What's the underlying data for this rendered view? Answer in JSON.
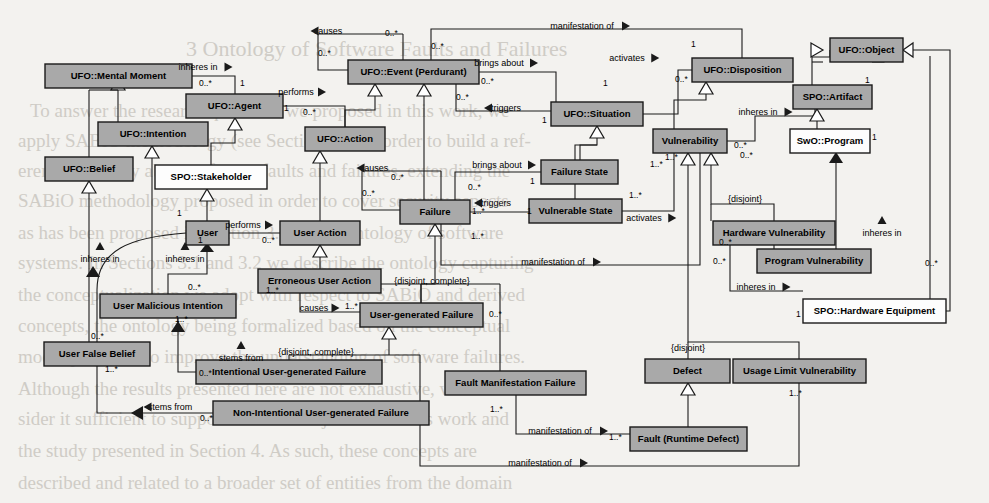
{
  "diagram": {
    "background_color": "#f3f2ef",
    "class_fill_gray": "#a9a9a9",
    "class_fill_white": "#fdfdfd",
    "stroke_color": "#1a1a1a",
    "width": 989,
    "height": 503
  },
  "classes": [
    {
      "id": "mental_moment",
      "label": "UFO::Mental Moment",
      "x": 45,
      "y": 64,
      "w": 147,
      "h": 24,
      "fill": "gray"
    },
    {
      "id": "agent",
      "label": "UFO::Agent",
      "x": 186,
      "y": 94,
      "w": 97,
      "h": 24,
      "fill": "gray"
    },
    {
      "id": "intention",
      "label": "UFO::Intention",
      "x": 98,
      "y": 122,
      "w": 110,
      "h": 24,
      "fill": "gray"
    },
    {
      "id": "belief",
      "label": "UFO::Belief",
      "x": 45,
      "y": 157,
      "w": 88,
      "h": 24,
      "fill": "gray"
    },
    {
      "id": "stakeholder",
      "label": "SPO::Stakeholder",
      "x": 155,
      "y": 165,
      "w": 112,
      "h": 24,
      "fill": "white"
    },
    {
      "id": "user",
      "label": "User",
      "x": 186,
      "y": 221,
      "w": 43,
      "h": 24,
      "fill": "gray"
    },
    {
      "id": "user_action",
      "label": "User Action",
      "x": 280,
      "y": 221,
      "w": 80,
      "h": 24,
      "fill": "gray"
    },
    {
      "id": "erroneous_user_action",
      "label": "Erroneous User Action",
      "x": 258,
      "y": 269,
      "w": 123,
      "h": 24,
      "fill": "gray"
    },
    {
      "id": "user_malicious_intention",
      "label": "User Malicious Intention",
      "x": 100,
      "y": 294,
      "w": 136,
      "h": 24,
      "fill": "gray"
    },
    {
      "id": "user_false_belief",
      "label": "User False Belief",
      "x": 44,
      "y": 342,
      "w": 106,
      "h": 24,
      "fill": "gray"
    },
    {
      "id": "intentional_ugf",
      "label": "Intentional User-generated Failure",
      "x": 196,
      "y": 360,
      "w": 186,
      "h": 24,
      "fill": "gray"
    },
    {
      "id": "non_intentional_ugf",
      "label": "Non-Intentional User-generated Failure",
      "x": 213,
      "y": 401,
      "w": 216,
      "h": 24,
      "fill": "gray"
    },
    {
      "id": "event",
      "label": "UFO::Event (Perdurant)",
      "x": 348,
      "y": 60,
      "w": 131,
      "h": 24,
      "fill": "gray"
    },
    {
      "id": "action",
      "label": "UFO::Action",
      "x": 305,
      "y": 127,
      "w": 80,
      "h": 24,
      "fill": "gray"
    },
    {
      "id": "situation",
      "label": "UFO::Situation",
      "x": 551,
      "y": 102,
      "w": 92,
      "h": 24,
      "fill": "gray"
    },
    {
      "id": "failure",
      "label": "Failure",
      "x": 400,
      "y": 200,
      "w": 70,
      "h": 24,
      "fill": "gray"
    },
    {
      "id": "failure_state",
      "label": "Failure State",
      "x": 541,
      "y": 160,
      "w": 77,
      "h": 24,
      "fill": "gray"
    },
    {
      "id": "vulnerable_state",
      "label": "Vulnerable State",
      "x": 529,
      "y": 199,
      "w": 93,
      "h": 24,
      "fill": "gray"
    },
    {
      "id": "user_generated_failure",
      "label": "User-generated Failure",
      "x": 360,
      "y": 303,
      "w": 123,
      "h": 24,
      "fill": "gray"
    },
    {
      "id": "fault_manifestation_failure",
      "label": "Fault Manifestation Failure",
      "x": 445,
      "y": 371,
      "w": 141,
      "h": 24,
      "fill": "gray"
    },
    {
      "id": "disposition",
      "label": "UFO::Disposition",
      "x": 692,
      "y": 58,
      "w": 101,
      "h": 24,
      "fill": "gray"
    },
    {
      "id": "object",
      "label": "UFO::Object",
      "x": 830,
      "y": 38,
      "w": 73,
      "h": 24,
      "fill": "gray"
    },
    {
      "id": "artifact",
      "label": "SPO::Artifact",
      "x": 793,
      "y": 85,
      "w": 79,
      "h": 24,
      "fill": "gray"
    },
    {
      "id": "program",
      "label": "SwO::Program",
      "x": 790,
      "y": 129,
      "w": 80,
      "h": 24,
      "fill": "white"
    },
    {
      "id": "vulnerability",
      "label": "Vulnerability",
      "x": 653,
      "y": 129,
      "w": 74,
      "h": 24,
      "fill": "gray"
    },
    {
      "id": "hardware_vulnerability",
      "label": "Hardware Vulnerability",
      "x": 713,
      "y": 221,
      "w": 122,
      "h": 24,
      "fill": "gray"
    },
    {
      "id": "program_vulnerability",
      "label": "Program Vulnerability",
      "x": 757,
      "y": 249,
      "w": 114,
      "h": 24,
      "fill": "gray"
    },
    {
      "id": "hardware_equipment",
      "label": "SPO::Hardware Equipment",
      "x": 803,
      "y": 299,
      "w": 143,
      "h": 24,
      "fill": "white"
    },
    {
      "id": "defect",
      "label": "Defect",
      "x": 645,
      "y": 359,
      "w": 85,
      "h": 24,
      "fill": "gray"
    },
    {
      "id": "usage_limit_vulnerability",
      "label": "Usage Limit Vulnerability",
      "x": 733,
      "y": 359,
      "w": 133,
      "h": 24,
      "fill": "gray"
    },
    {
      "id": "fault",
      "label": "Fault (Runtime Defect)",
      "x": 630,
      "y": 427,
      "w": 117,
      "h": 24,
      "fill": "gray"
    }
  ],
  "relation_labels": [
    {
      "id": "causes_event",
      "text": "causes",
      "x": 328,
      "y": 34,
      "arrow": "left"
    },
    {
      "id": "manifestation_of_top",
      "text": "manifestation of",
      "x": 582,
      "y": 29,
      "arrow": "right"
    },
    {
      "id": "inheres_in_agent",
      "text": "inheres in",
      "x": 198,
      "y": 70,
      "arrow": "right"
    },
    {
      "id": "brings_about_event",
      "text": "brings about",
      "x": 499,
      "y": 66,
      "arrow": "right"
    },
    {
      "id": "activates_situation",
      "text": "activates",
      "x": 627,
      "y": 61,
      "arrow": "right"
    },
    {
      "id": "performs_agent",
      "text": "performs",
      "x": 296,
      "y": 95,
      "arrow": "right"
    },
    {
      "id": "triggers_situation",
      "text": "triggers",
      "x": 506,
      "y": 111,
      "arrow": "left"
    },
    {
      "id": "inheres_in_artifact",
      "text": "inheres in",
      "x": 758,
      "y": 115,
      "arrow": "right"
    },
    {
      "id": "causes_failure",
      "text": "causes",
      "x": 374,
      "y": 171,
      "arrow": "left"
    },
    {
      "id": "brings_about_failure_state",
      "text": "brings about",
      "x": 497,
      "y": 168,
      "arrow": "right"
    },
    {
      "id": "triggers_failure",
      "text": "triggers",
      "x": 496,
      "y": 206,
      "arrow": "left"
    },
    {
      "id": "performs_user",
      "text": "performs",
      "x": 243,
      "y": 228,
      "arrow": "right"
    },
    {
      "id": "activates_vulnerable",
      "text": "activates",
      "x": 644,
      "y": 221,
      "arrow": "right"
    },
    {
      "id": "inheres_in_program",
      "text": "inheres in",
      "x": 882,
      "y": 236,
      "arrow": "up"
    },
    {
      "id": "inheres_in_user_false_belief",
      "text": "inheres in",
      "x": 100,
      "y": 262,
      "arrow": "up"
    },
    {
      "id": "inheres_in_user",
      "text": "inheres in",
      "x": 185,
      "y": 262,
      "arrow": "up"
    },
    {
      "id": "manifestation_of_mid",
      "text": "manifestation of",
      "x": 553,
      "y": 265,
      "arrow": "right"
    },
    {
      "id": "causes_ugf",
      "text": "causes",
      "x": 314,
      "y": 311,
      "arrow": "right"
    },
    {
      "id": "inheres_in_hw_equipment",
      "text": "inheres in",
      "x": 756,
      "y": 290,
      "arrow": "right"
    },
    {
      "id": "stems_from_intentional",
      "text": "stems from",
      "x": 241,
      "y": 361,
      "arrow": "up"
    },
    {
      "id": "stems_from_non_intentional",
      "text": "stems from",
      "x": 170,
      "y": 410,
      "arrow": "left"
    },
    {
      "id": "manifestation_of_fault",
      "text": "manifestation of",
      "x": 560,
      "y": 434,
      "arrow": "right"
    },
    {
      "id": "manifestation_of_bottom",
      "text": "manifestation of",
      "x": 540,
      "y": 466,
      "arrow": "right"
    }
  ],
  "multiplicities": [
    {
      "text": "0..*",
      "x": 385,
      "y": 36
    },
    {
      "text": "0..*",
      "x": 431,
      "y": 49
    },
    {
      "text": "0..*",
      "x": 318,
      "y": 56
    },
    {
      "text": "0..*",
      "x": 199,
      "y": 86
    },
    {
      "text": "1",
      "x": 240,
      "y": 86
    },
    {
      "text": "1",
      "x": 284,
      "y": 111
    },
    {
      "text": "1",
      "x": 691,
      "y": 47
    },
    {
      "text": "0..*",
      "x": 481,
      "y": 84
    },
    {
      "text": "0..*",
      "x": 675,
      "y": 82
    },
    {
      "text": "0..*",
      "x": 303,
      "y": 115
    },
    {
      "text": "1",
      "x": 603,
      "y": 86
    },
    {
      "text": "0..*",
      "x": 456,
      "y": 100
    },
    {
      "text": "1",
      "x": 542,
      "y": 123
    },
    {
      "text": "1",
      "x": 865,
      "y": 83
    },
    {
      "text": "0..*",
      "x": 734,
      "y": 148
    },
    {
      "text": "1",
      "x": 872,
      "y": 140
    },
    {
      "text": "0..*",
      "x": 391,
      "y": 180
    },
    {
      "text": "0..*",
      "x": 362,
      "y": 196
    },
    {
      "text": "0..*",
      "x": 468,
      "y": 190
    },
    {
      "text": "1",
      "x": 530,
      "y": 184
    },
    {
      "text": "1..*",
      "x": 472,
      "y": 214
    },
    {
      "text": "1",
      "x": 527,
      "y": 214
    },
    {
      "text": "1..*",
      "x": 629,
      "y": 198
    },
    {
      "text": "1..*",
      "x": 650,
      "y": 167
    },
    {
      "text": "1..*",
      "x": 665,
      "y": 160
    },
    {
      "text": "1..*",
      "x": 471,
      "y": 239
    },
    {
      "text": "1",
      "x": 177,
      "y": 216
    },
    {
      "text": "1",
      "x": 198,
      "y": 243
    },
    {
      "text": "0..*",
      "x": 262,
      "y": 243
    },
    {
      "text": "1..*",
      "x": 266,
      "y": 293
    },
    {
      "text": "1..*",
      "x": 345,
      "y": 309
    },
    {
      "text": "0..*",
      "x": 188,
      "y": 290
    },
    {
      "text": "1..*",
      "x": 175,
      "y": 322
    },
    {
      "text": "0..*",
      "x": 91,
      "y": 339
    },
    {
      "text": "1..*",
      "x": 105,
      "y": 372
    },
    {
      "text": "0..*",
      "x": 199,
      "y": 376
    },
    {
      "text": "0..*",
      "x": 200,
      "y": 421
    },
    {
      "text": "0..*",
      "x": 489,
      "y": 317
    },
    {
      "text": "0..*",
      "x": 713,
      "y": 264
    },
    {
      "text": "0..*",
      "x": 719,
      "y": 245
    },
    {
      "text": "0..*",
      "x": 925,
      "y": 266
    },
    {
      "text": "1",
      "x": 796,
      "y": 317
    },
    {
      "text": "1..*",
      "x": 490,
      "y": 412
    },
    {
      "text": "1..*",
      "x": 609,
      "y": 440
    },
    {
      "text": "1..*",
      "x": 789,
      "y": 396
    },
    {
      "text": "0..*",
      "x": 740,
      "y": 158
    }
  ],
  "constraints": [
    {
      "text": "{disjoint, complete}",
      "x": 432,
      "y": 284
    },
    {
      "text": "{disjoint, complete}",
      "x": 316,
      "y": 355
    },
    {
      "text": "{disjoint}",
      "x": 745,
      "y": 202
    },
    {
      "text": "{disjoint}",
      "x": 688,
      "y": 351
    }
  ],
  "ghost_text": [
    {
      "text": "3  Ontology of Software Faults and Failures",
      "x": 186,
      "y": 36,
      "size": 22
    },
    {
      "text": "To answer the research questions we proposed in this work, we",
      "x": 30,
      "y": 100,
      "size": 19
    },
    {
      "text": "apply  SABiO  methodology (see  Section  2.5)  in order to build a ref-",
      "x": 18,
      "y": 130,
      "size": 19
    },
    {
      "text": "erence ontology about software faults and failures, extending the",
      "x": 18,
      "y": 160,
      "size": 19
    },
    {
      "text": "SABiO methodology proposed in order to cover security aspects",
      "x": 18,
      "y": 190,
      "size": 19
    },
    {
      "text": "as has been proposed in  Section 3.1 on  the  ontology of software",
      "x": 18,
      "y": 222,
      "size": 19
    },
    {
      "text": "systems. In Sections 3.1 and 3.2 we describe the ontology capturing",
      "x": 18,
      "y": 252,
      "size": 19
    },
    {
      "text": "the conceptualization we adopt with respect to SABiO  and derived",
      "x": 18,
      "y": 284,
      "size": 19
    },
    {
      "text": "concepts, the ontology being formalized based on the conceptual",
      "x": 18,
      "y": 315,
      "size": 19
    },
    {
      "text": "model proposed to improve the understanding of software failures.",
      "x": 18,
      "y": 346,
      "size": 19
    },
    {
      "text": "Although the results presented here are not exhaustive, we con-",
      "x": 18,
      "y": 378,
      "size": 19
    },
    {
      "text": "sider it sufficient to support the main objectives of this work and",
      "x": 18,
      "y": 408,
      "size": 19
    },
    {
      "text": "the  study  presented  in  Section  4.  As  such,  these  concepts  are",
      "x": 18,
      "y": 440,
      "size": 19
    },
    {
      "text": "described and related to a broader set of entities from the domain",
      "x": 18,
      "y": 472,
      "size": 19
    }
  ]
}
